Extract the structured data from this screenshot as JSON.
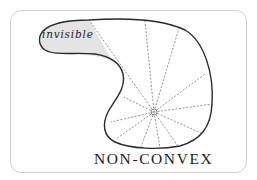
{
  "diagram": {
    "title": "NON-CONVEX",
    "region_label": "invisible",
    "colors": {
      "outline": "#2a2a2a",
      "ray": "#777777",
      "invisible_fill": "#e4e4e4",
      "frame": "#cfcfcf"
    },
    "viewpoint": {
      "x": 154,
      "y": 112
    },
    "rays": [
      {
        "to": [
          89,
          20
        ],
        "note": "boundary of invisible region"
      },
      {
        "to": [
          145,
          21
        ]
      },
      {
        "to": [
          179,
          28
        ]
      },
      {
        "to": [
          205,
          74
        ]
      },
      {
        "to": [
          212,
          104
        ]
      },
      {
        "to": [
          201,
          133
        ]
      },
      {
        "to": [
          178,
          146
        ]
      },
      {
        "to": [
          160,
          148
        ]
      },
      {
        "to": [
          141,
          147
        ]
      },
      {
        "to": [
          116,
          139
        ]
      },
      {
        "to": [
          111,
          122
        ]
      },
      {
        "to": [
          124,
          97
        ]
      }
    ]
  }
}
